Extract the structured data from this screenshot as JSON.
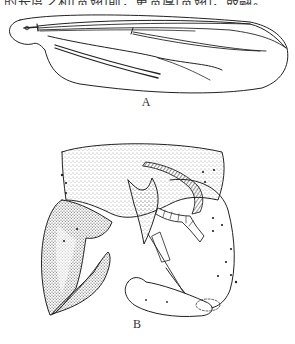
{
  "figure": {
    "top_caption_partial": "的长度之和[宽翅]前，更宽厚[宽翅]，鼓翮。",
    "panels": [
      {
        "id": "A",
        "label": "A",
        "subject": "wing"
      },
      {
        "id": "B",
        "label": "B",
        "subject": "genitalia"
      }
    ]
  },
  "colors": {
    "ink": "#222222",
    "stipple": "#555555",
    "background": "#ffffff"
  }
}
